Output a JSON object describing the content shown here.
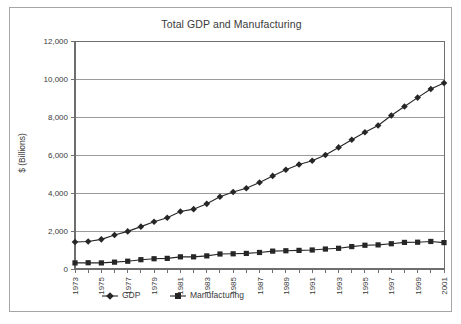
{
  "chart_data": {
    "type": "line",
    "title": "Total GDP and Manufacturing",
    "xlabel": "",
    "ylabel": "$ (Billions)",
    "ylim": [
      0,
      12000
    ],
    "ytick_values": [
      0,
      2000,
      4000,
      6000,
      8000,
      10000,
      12000
    ],
    "ytick_labels": [
      "0",
      "2,000",
      "4,000",
      "6,000",
      "8,000",
      "10,000",
      "12,000"
    ],
    "grid": true,
    "legend_position": "bottom",
    "x": [
      1973,
      1974,
      1975,
      1976,
      1977,
      1978,
      1979,
      1980,
      1981,
      1982,
      1983,
      1984,
      1985,
      1986,
      1987,
      1988,
      1989,
      1990,
      1991,
      1992,
      1993,
      1994,
      1995,
      1996,
      1997,
      1998,
      1999,
      2000,
      2001
    ],
    "xtick_labels": [
      "1973",
      "",
      "1975",
      "",
      "1977",
      "",
      "1979",
      "",
      "1981",
      "",
      "1983",
      "",
      "1985",
      "",
      "1987",
      "",
      "1989",
      "",
      "1991",
      "",
      "1993",
      "",
      "1995",
      "",
      "1997",
      "",
      "1999",
      "",
      "2001"
    ],
    "series": [
      {
        "name": "GDP",
        "marker": "diamond",
        "color": "#262626",
        "values": [
          1420,
          1450,
          1560,
          1790,
          1980,
          2230,
          2490,
          2700,
          3030,
          3150,
          3430,
          3800,
          4050,
          4250,
          4550,
          4900,
          5220,
          5500,
          5700,
          6000,
          6400,
          6800,
          7200,
          7550,
          8080,
          8550,
          9020,
          9470,
          9790
        ]
      },
      {
        "name": "Manufacturing",
        "marker": "square",
        "color": "#262626",
        "values": [
          320,
          330,
          320,
          360,
          410,
          490,
          540,
          560,
          640,
          640,
          690,
          790,
          800,
          820,
          870,
          940,
          960,
          980,
          1000,
          1050,
          1090,
          1180,
          1250,
          1270,
          1330,
          1400,
          1410,
          1450,
          1390
        ]
      }
    ]
  },
  "legend": {
    "items": [
      {
        "label": "GDP",
        "marker": "diamond"
      },
      {
        "label": "Manufacturing",
        "marker": "square"
      }
    ]
  }
}
